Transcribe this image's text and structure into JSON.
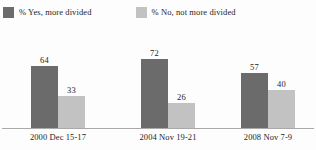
{
  "chart_data": {
    "type": "bar",
    "title": "",
    "subtitle": "",
    "xlabel": "",
    "ylabel": "",
    "ylim": [
      0,
      100
    ],
    "grid": false,
    "legend_position": "top-left",
    "categories": [
      "2000 Dec 15-17",
      "2004 Nov 19-21",
      "2008 Nov 7-9"
    ],
    "series": [
      {
        "name": "% Yes, more divided",
        "color": "#6b6b6b",
        "values": [
          64,
          72,
          57
        ]
      },
      {
        "name": "% No, not more divided",
        "color": "#c2c2c2",
        "values": [
          33,
          26,
          40
        ]
      }
    ],
    "axis_color": "#a9a9a9",
    "background": "#fdfdfd"
  },
  "legend": {
    "items": [
      {
        "label": "% Yes, more divided",
        "swatch": "#6b6b6b"
      },
      {
        "label": "% No, not more divided",
        "swatch": "#c2c2c2"
      }
    ]
  }
}
